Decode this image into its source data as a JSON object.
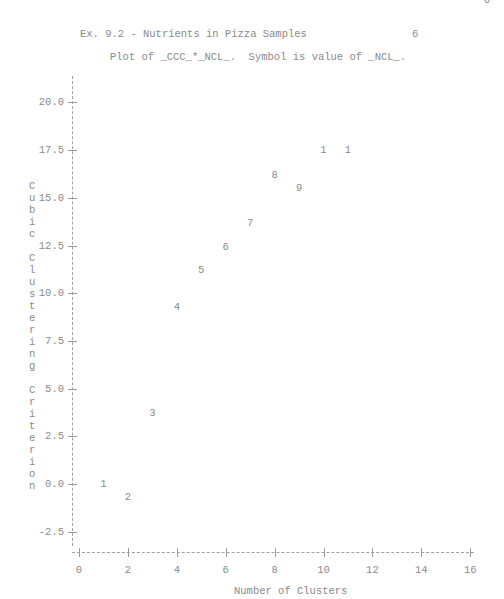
{
  "header": {
    "title": "Ex. 9.2 - Nutrients in Pizza Samples",
    "page_number": "6",
    "corner_mark": "6",
    "subtitle": "Plot of _CCC_*_NCL_.  Symbol is value of _NCL_."
  },
  "axes": {
    "y_label_chars": [
      "C",
      "u",
      "b",
      "i",
      "c",
      " ",
      "C",
      "l",
      "u",
      "s",
      "t",
      "e",
      "r",
      "i",
      "n",
      "g",
      " ",
      "C",
      "r",
      "i",
      "t",
      "e",
      "r",
      "i",
      "o",
      "n"
    ],
    "y_ticks": [
      "20.0",
      "17.5",
      "15.0",
      "12.5",
      "10.0",
      "7.5",
      "5.0",
      "2.5",
      "0.0",
      "-2.5"
    ],
    "x_ticks": [
      "0",
      "2",
      "4",
      "6",
      "8",
      "10",
      "12",
      "14",
      "16"
    ],
    "x_label": "Number of Clusters"
  },
  "chart_data": {
    "type": "scatter",
    "title": "Plot of _CCC_*_NCL_.  Symbol is value of _NCL_.",
    "suptitle": "Ex. 9.2 - Nutrients in Pizza Samples",
    "xlabel": "Number of Clusters",
    "ylabel": "Cubic Clustering Criterion",
    "xlim": [
      0,
      16
    ],
    "ylim": [
      -2.5,
      20.0
    ],
    "x_ticks": [
      0,
      2,
      4,
      6,
      8,
      10,
      12,
      14,
      16
    ],
    "y_ticks": [
      -2.5,
      0.0,
      2.5,
      5.0,
      7.5,
      10.0,
      12.5,
      15.0,
      17.5,
      20.0
    ],
    "grid": false,
    "legend": "none",
    "points": [
      {
        "x": 1,
        "y": 0.0,
        "symbol": "1"
      },
      {
        "x": 2,
        "y": -0.7,
        "symbol": "2"
      },
      {
        "x": 3,
        "y": 3.7,
        "symbol": "3"
      },
      {
        "x": 4,
        "y": 9.3,
        "symbol": "4"
      },
      {
        "x": 5,
        "y": 11.2,
        "symbol": "5"
      },
      {
        "x": 6,
        "y": 12.4,
        "symbol": "6"
      },
      {
        "x": 7,
        "y": 13.7,
        "symbol": "7"
      },
      {
        "x": 8,
        "y": 16.2,
        "symbol": "8"
      },
      {
        "x": 9,
        "y": 15.5,
        "symbol": "9"
      },
      {
        "x": 10,
        "y": 17.5,
        "symbol": "1"
      },
      {
        "x": 11,
        "y": 17.5,
        "symbol": "1"
      }
    ]
  }
}
